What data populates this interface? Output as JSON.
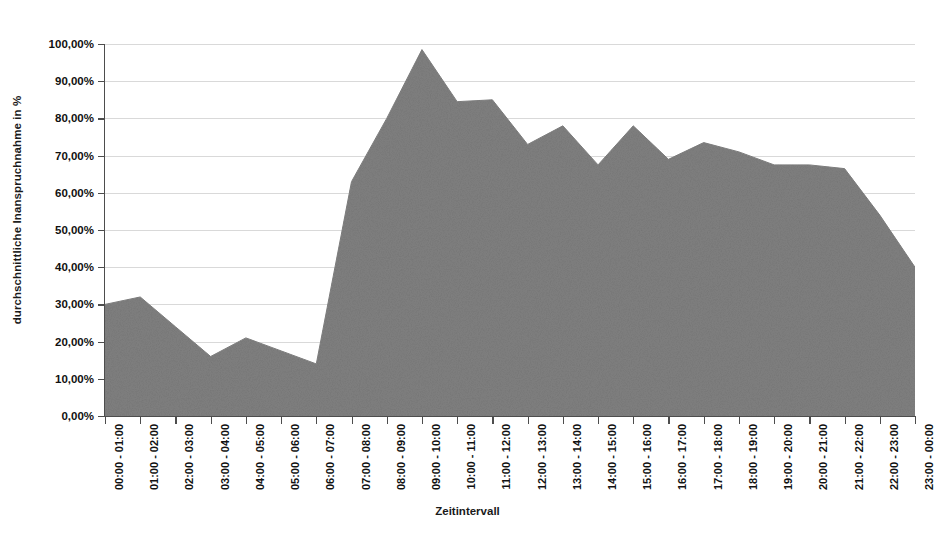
{
  "chart_data": {
    "type": "area",
    "title": "",
    "xlabel": "Zeitintervall",
    "ylabel": "durchschnittliche Inanspruchnahme in %",
    "ylim": [
      0,
      100
    ],
    "ytick_values": [
      0,
      10,
      20,
      30,
      40,
      50,
      60,
      70,
      80,
      90,
      100
    ],
    "ytick_labels": [
      "0,00%",
      "10,00%",
      "20,00%",
      "30,00%",
      "40,00%",
      "50,00%",
      "60,00%",
      "70,00%",
      "80,00%",
      "90,00%",
      "100,00%"
    ],
    "grid": true,
    "legend": "none",
    "series_color": "#808080",
    "series": [
      {
        "name": "durchschnittliche Inanspruchnahme",
        "values": [
          30.0,
          32.0,
          24.0,
          16.0,
          21.0,
          17.5,
          14.0,
          63.0,
          80.0,
          98.5,
          84.5,
          85.0,
          73.0,
          78.0,
          67.5,
          78.0,
          69.0,
          73.5,
          71.0,
          67.5,
          67.5,
          66.5,
          54.0,
          40.0
        ]
      }
    ],
    "categories": [
      "00:00 - 01:00",
      "01:00 - 02:00",
      "02:00 - 03:00",
      "03:00 - 04:00",
      "04:00 - 05:00",
      "05:00 - 06:00",
      "06:00 - 07:00",
      "07:00 - 08:00",
      "08:00 - 09:00",
      "09:00 - 10:00",
      "10:00 - 11:00",
      "11:00 - 12:00",
      "12:00 - 13:00",
      "13:00 - 14:00",
      "14:00 - 15:00",
      "15:00 - 16:00",
      "16:00 - 17:00",
      "17:00 - 18:00",
      "18:00 - 19:00",
      "19:00 - 20:00",
      "20:00 - 21:00",
      "21:00 - 22:00",
      "22:00 - 23:00",
      "23:00 - 00:00"
    ]
  }
}
